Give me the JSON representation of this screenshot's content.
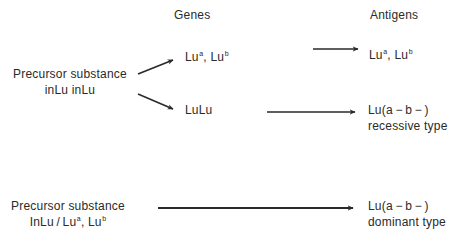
{
  "headers": {
    "genes": "Genes",
    "antigens": "Antigens"
  },
  "recessive_pathway": {
    "precursor": {
      "line1": "Precursor substance",
      "line2": "inLu inLu"
    },
    "gene_upper": {
      "base1": "Lu",
      "sup1": "a",
      "sep": ", ",
      "base2": "Lu",
      "sup2": "b"
    },
    "gene_lower": "LuLu",
    "antigen_upper": {
      "base1": "Lu",
      "sup1": "a",
      "sep": ", ",
      "base2": "Lu",
      "sup2": "b"
    },
    "antigen_lower": {
      "line1": "Lu(a − b − )",
      "line2": "recessive type"
    }
  },
  "dominant_pathway": {
    "precursor": {
      "line1": "Precursor substance",
      "line2_prefix": "InLu / Lu",
      "sup1": "a",
      "sep": ", Lu",
      "sup2": "b"
    },
    "antigen": {
      "line1": "Lu(a − b − )",
      "line2": "dominant type"
    }
  },
  "colors": {
    "text": "#2a2a2a",
    "arrow": "#2a2a2a",
    "background": "#ffffff"
  }
}
